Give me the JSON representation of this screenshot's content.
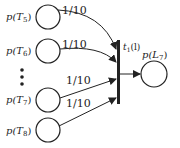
{
  "diagram": {
    "type": "petri-net",
    "input_places": [
      {
        "id": "T5",
        "label": "p(T",
        "sub": "5",
        "weight": "1/10"
      },
      {
        "id": "T6",
        "label": "p(T",
        "sub": "6",
        "weight": "1/10"
      },
      {
        "id": "T7",
        "label": "p(T",
        "sub": "7",
        "weight": "1/10"
      },
      {
        "id": "T8",
        "label": "p(T",
        "sub": "8",
        "weight": "1/10"
      }
    ],
    "transition": {
      "label": "t",
      "sub": "1",
      "arg": "(l)"
    },
    "output_place": {
      "label": "p(L",
      "sub": "7"
    },
    "ellipsis": "⋮",
    "colors": {
      "stroke": "#222222",
      "background": "#ffffff"
    }
  }
}
